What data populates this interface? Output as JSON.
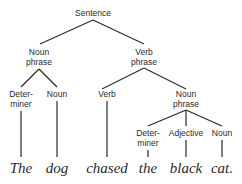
{
  "diagram": {
    "type": "syntax-tree",
    "line_color": "#2a2a2a",
    "nodes": [
      {
        "id": "s",
        "label": "Sentence",
        "x": 93,
        "y": 8
      },
      {
        "id": "np1",
        "label": "Noun\nphrase",
        "x": 39,
        "y": 47
      },
      {
        "id": "vp",
        "label": "Verb\nphrase",
        "x": 144,
        "y": 47
      },
      {
        "id": "det1",
        "label": "Deter-\nminer",
        "x": 21,
        "y": 89
      },
      {
        "id": "n1",
        "label": "Noun",
        "x": 57,
        "y": 89
      },
      {
        "id": "v",
        "label": "Verb",
        "x": 107,
        "y": 89
      },
      {
        "id": "np2",
        "label": "Noun\nphrase",
        "x": 186,
        "y": 89
      },
      {
        "id": "det2",
        "label": "Deter-\nminer",
        "x": 148,
        "y": 128
      },
      {
        "id": "adj",
        "label": "Adjective",
        "x": 186,
        "y": 128
      },
      {
        "id": "n2",
        "label": "Noun",
        "x": 222,
        "y": 128
      }
    ],
    "words": [
      {
        "text": "The",
        "x": 21,
        "y": 160
      },
      {
        "text": "dog",
        "x": 57,
        "y": 160
      },
      {
        "text": "chased",
        "x": 107,
        "y": 160
      },
      {
        "text": "the",
        "x": 148,
        "y": 160
      },
      {
        "text": "black",
        "x": 186,
        "y": 160
      },
      {
        "text": "cat.",
        "x": 222,
        "y": 160
      }
    ],
    "edges": [
      {
        "from": "s",
        "to": "np1",
        "x1": 93,
        "y1": 20,
        "x2": 40,
        "y2": 44
      },
      {
        "from": "s",
        "to": "vp",
        "x1": 93,
        "y1": 20,
        "x2": 144,
        "y2": 44
      },
      {
        "from": "np1",
        "to": "det1",
        "x1": 39,
        "y1": 69,
        "x2": 21,
        "y2": 87
      },
      {
        "from": "np1",
        "to": "n1",
        "x1": 39,
        "y1": 69,
        "x2": 57,
        "y2": 87
      },
      {
        "from": "vp",
        "to": "v",
        "x1": 144,
        "y1": 68,
        "x2": 102,
        "y2": 89
      },
      {
        "from": "vp",
        "to": "np2",
        "x1": 144,
        "y1": 68,
        "x2": 186,
        "y2": 89
      },
      {
        "from": "np2",
        "to": "det2",
        "x1": 186,
        "y1": 110,
        "x2": 148,
        "y2": 126
      },
      {
        "from": "np2",
        "to": "adj",
        "x1": 186,
        "y1": 110,
        "x2": 186,
        "y2": 126
      },
      {
        "from": "np2",
        "to": "n2",
        "x1": 186,
        "y1": 110,
        "x2": 222,
        "y2": 126
      },
      {
        "from": "det1",
        "to": "The",
        "x1": 21,
        "y1": 111,
        "x2": 21,
        "y2": 157
      },
      {
        "from": "n1",
        "to": "dog",
        "x1": 57,
        "y1": 101,
        "x2": 57,
        "y2": 157
      },
      {
        "from": "v",
        "to": "chased",
        "x1": 107,
        "y1": 101,
        "x2": 107,
        "y2": 157
      },
      {
        "from": "det2",
        "to": "the",
        "x1": 148,
        "y1": 150,
        "x2": 148,
        "y2": 157
      },
      {
        "from": "adj",
        "to": "black",
        "x1": 186,
        "y1": 140,
        "x2": 186,
        "y2": 157
      },
      {
        "from": "n2",
        "to": "cat.",
        "x1": 222,
        "y1": 140,
        "x2": 222,
        "y2": 157
      }
    ]
  }
}
